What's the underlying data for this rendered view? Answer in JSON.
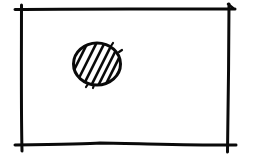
{
  "diagram": {
    "style": "hand-drawn ink sketch",
    "ink_color": "#0a0a0a",
    "background_color": "#ffffff",
    "elements": [
      {
        "kind": "rectangle-frame",
        "fill": "none",
        "corners": "overshooting strokes"
      },
      {
        "kind": "circle",
        "fill": "diagonal hatching",
        "placement": "upper-left of frame interior"
      }
    ]
  }
}
